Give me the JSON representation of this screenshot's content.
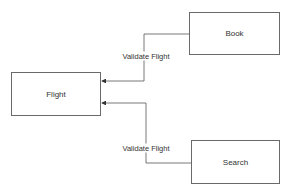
{
  "diagram": {
    "nodes": [
      {
        "id": "flight",
        "label": "Flight",
        "x": 11,
        "y": 72,
        "w": 90,
        "h": 44
      },
      {
        "id": "book",
        "label": "Book",
        "x": 189,
        "y": 12,
        "w": 91,
        "h": 43
      },
      {
        "id": "search",
        "label": "Search",
        "x": 191,
        "y": 140,
        "w": 89,
        "h": 44
      }
    ],
    "edges": [
      {
        "from": "book",
        "to": "flight",
        "label": "Validate Flight",
        "points": [
          [
            189,
            34
          ],
          [
            144,
            34
          ],
          [
            144,
            81
          ],
          [
            101,
            81
          ]
        ],
        "label_pos": [
          146,
          56
        ]
      },
      {
        "from": "search",
        "to": "flight",
        "label": "Validate Flight",
        "points": [
          [
            191,
            163
          ],
          [
            146,
            163
          ],
          [
            146,
            103
          ],
          [
            101,
            103
          ]
        ],
        "label_pos": [
          146,
          148
        ]
      }
    ],
    "colors": {
      "line": "#555555",
      "border": "#6a6a6a",
      "text": "#333333"
    }
  }
}
